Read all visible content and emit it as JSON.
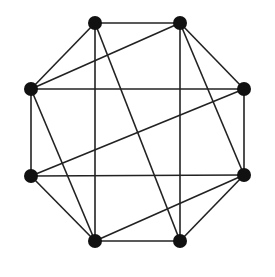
{
  "diagram": {
    "type": "graph",
    "title": "",
    "nodes": [
      {
        "id": "A",
        "position": "top-left",
        "x": 95,
        "y": 23
      },
      {
        "id": "B",
        "position": "top-right",
        "x": 180,
        "y": 23
      },
      {
        "id": "C",
        "position": "right-upper",
        "x": 244,
        "y": 89
      },
      {
        "id": "D",
        "position": "right-lower",
        "x": 244,
        "y": 175
      },
      {
        "id": "E",
        "position": "bottom-right",
        "x": 180,
        "y": 241
      },
      {
        "id": "F",
        "position": "bottom-left",
        "x": 95,
        "y": 241
      },
      {
        "id": "G",
        "position": "left-lower",
        "x": 31,
        "y": 176
      },
      {
        "id": "H",
        "position": "left-upper",
        "x": 31,
        "y": 89
      }
    ],
    "edges": [
      [
        "A",
        "B"
      ],
      [
        "B",
        "C"
      ],
      [
        "C",
        "D"
      ],
      [
        "D",
        "E"
      ],
      [
        "E",
        "F"
      ],
      [
        "F",
        "G"
      ],
      [
        "G",
        "H"
      ],
      [
        "H",
        "A"
      ],
      [
        "H",
        "C"
      ],
      [
        "G",
        "D"
      ],
      [
        "A",
        "F"
      ],
      [
        "B",
        "E"
      ],
      [
        "H",
        "B"
      ],
      [
        "G",
        "C"
      ],
      [
        "F",
        "D"
      ],
      [
        "A",
        "E"
      ],
      [
        "B",
        "D"
      ],
      [
        "H",
        "F"
      ]
    ],
    "colors": {
      "node": "#111111",
      "edge": "#222222",
      "background": "#ffffff"
    },
    "node_radius": 7
  }
}
